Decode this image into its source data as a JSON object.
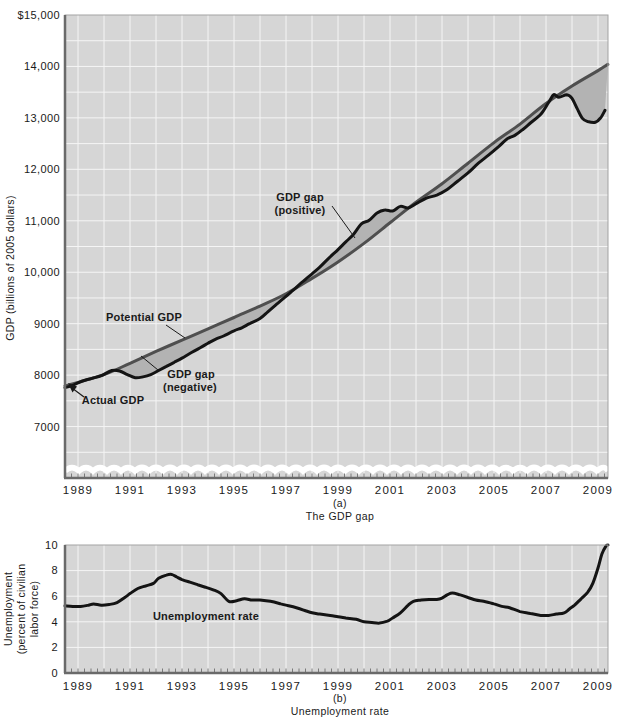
{
  "colors": {
    "page_bg": "#ffffff",
    "plot_bg": "#d6d6d6",
    "grid": "#f5f5f5",
    "actual_line": "#141414",
    "potential_line": "#4f4f4f",
    "unemployment_line": "#141414",
    "gap_fill": "#b3b3b3",
    "frame": "#a3a3a3",
    "axis_dark": "#6a6a6a",
    "tick_mark": "#7a7a7a",
    "text": "#1a1a1a"
  },
  "panel_a": {
    "axis_title": "GDP (billions of 2005 dollars)",
    "y_ticks": [
      "$15,000",
      "14,000",
      "13,000",
      "12,000",
      "11,000",
      "10,000",
      "9000",
      "8000",
      "7000"
    ],
    "x_ticks": [
      "1989",
      "1991",
      "1993",
      "1995",
      "1997",
      "1999",
      "2001",
      "2003",
      "2005",
      "2007",
      "2009"
    ],
    "annotations": {
      "gap_positive_line1": "GDP gap",
      "gap_positive_line2": "(positive)",
      "potential": "Potential GDP",
      "gap_negative_line1": "GDP gap",
      "gap_negative_line2": "(negative)",
      "actual": "Actual GDP"
    },
    "caption_letter": "(a)",
    "caption_title": "The GDP gap"
  },
  "panel_b": {
    "axis_title_line1": "Unemployment",
    "axis_title_line2": "(percent of civilian",
    "axis_title_line3": "labor force)",
    "y_ticks": [
      "10",
      "8",
      "6",
      "4",
      "2",
      "0"
    ],
    "x_ticks": [
      "1989",
      "1991",
      "1993",
      "1995",
      "1997",
      "1999",
      "2001",
      "2003",
      "2005",
      "2007",
      "2009"
    ],
    "annotation": "Unemployment rate",
    "caption_letter": "(b)",
    "caption_title": "Unemployment rate"
  },
  "chart_data": [
    {
      "type": "line",
      "panel": "(a)",
      "title": "The GDP gap",
      "ylabel": "GDP (billions of 2005 dollars)",
      "xlim": [
        1988.5,
        2009.385
      ],
      "ylim": [
        6000,
        15000
      ],
      "axis_break_at_bottom": true,
      "grid": "fine white grid, yearly vertical lines, horizontal lines every 500",
      "x_tick_values": [
        1989,
        1991,
        1993,
        1995,
        1997,
        1999,
        2001,
        2003,
        2005,
        2007,
        2009
      ],
      "y_tick_values": [
        15000,
        14000,
        13000,
        12000,
        11000,
        10000,
        9000,
        8000,
        7000
      ],
      "gap_fill_color": "#b3b3b3",
      "series": [
        {
          "name": "Actual GDP",
          "color": "#141414",
          "points": [
            [
              1988.5,
              7755
            ],
            [
              1988.8,
              7800
            ],
            [
              1989.0,
              7850
            ],
            [
              1989.3,
              7905
            ],
            [
              1989.6,
              7945
            ],
            [
              1989.9,
              7990
            ],
            [
              1990.3,
              8090
            ],
            [
              1990.6,
              8080
            ],
            [
              1990.9,
              8010
            ],
            [
              1991.2,
              7950
            ],
            [
              1991.5,
              7965
            ],
            [
              1991.8,
              8010
            ],
            [
              1992.1,
              8090
            ],
            [
              1992.4,
              8170
            ],
            [
              1992.7,
              8250
            ],
            [
              1993.0,
              8330
            ],
            [
              1993.3,
              8420
            ],
            [
              1993.7,
              8530
            ],
            [
              1994.0,
              8620
            ],
            [
              1994.3,
              8700
            ],
            [
              1994.6,
              8760
            ],
            [
              1995.0,
              8860
            ],
            [
              1995.3,
              8920
            ],
            [
              1995.6,
              9000
            ],
            [
              1996.0,
              9100
            ],
            [
              1996.3,
              9230
            ],
            [
              1996.6,
              9360
            ],
            [
              1997.0,
              9530
            ],
            [
              1997.3,
              9660
            ],
            [
              1997.6,
              9800
            ],
            [
              1998.0,
              9970
            ],
            [
              1998.3,
              10100
            ],
            [
              1998.6,
              10250
            ],
            [
              1999.0,
              10440
            ],
            [
              1999.3,
              10590
            ],
            [
              1999.6,
              10740
            ],
            [
              1999.9,
              10940
            ],
            [
              2000.2,
              11010
            ],
            [
              2000.5,
              11150
            ],
            [
              2000.8,
              11210
            ],
            [
              2001.1,
              11190
            ],
            [
              2001.4,
              11280
            ],
            [
              2001.7,
              11250
            ],
            [
              2002.0,
              11330
            ],
            [
              2002.4,
              11440
            ],
            [
              2002.8,
              11500
            ],
            [
              2003.2,
              11610
            ],
            [
              2003.6,
              11770
            ],
            [
              2004.0,
              11930
            ],
            [
              2004.4,
              12120
            ],
            [
              2004.8,
              12280
            ],
            [
              2005.2,
              12450
            ],
            [
              2005.5,
              12590
            ],
            [
              2005.8,
              12660
            ],
            [
              2006.1,
              12770
            ],
            [
              2006.4,
              12900
            ],
            [
              2006.8,
              13070
            ],
            [
              2007.1,
              13300
            ],
            [
              2007.3,
              13450
            ],
            [
              2007.5,
              13400
            ],
            [
              2007.8,
              13450
            ],
            [
              2008.0,
              13380
            ],
            [
              2008.2,
              13180
            ],
            [
              2008.4,
              12990
            ],
            [
              2008.6,
              12930
            ],
            [
              2008.9,
              12915
            ],
            [
              2009.1,
              13000
            ],
            [
              2009.27,
              13150
            ]
          ]
        },
        {
          "name": "Potential GDP",
          "color": "#4f4f4f",
          "points": [
            [
              1988.5,
              7790
            ],
            [
              1990,
              8010
            ],
            [
              1991,
              8230
            ],
            [
              1992,
              8460
            ],
            [
              1993,
              8680
            ],
            [
              1994,
              8900
            ],
            [
              1995,
              9120
            ],
            [
              1996,
              9340
            ],
            [
              1997,
              9580
            ],
            [
              1998,
              9880
            ],
            [
              1999,
              10200
            ],
            [
              2000,
              10560
            ],
            [
              2001,
              10960
            ],
            [
              2002,
              11360
            ],
            [
              2003,
              11720
            ],
            [
              2004,
              12120
            ],
            [
              2005,
              12520
            ],
            [
              2006,
              12880
            ],
            [
              2007,
              13280
            ],
            [
              2008,
              13620
            ],
            [
              2009,
              13920
            ],
            [
              2009.38,
              14040
            ]
          ]
        }
      ]
    },
    {
      "type": "line",
      "panel": "(b)",
      "title": "Unemployment rate",
      "ylabel": "Unemployment (percent of civilian labor force)",
      "xlim": [
        1988.5,
        2009.385
      ],
      "ylim": [
        0,
        10
      ],
      "x_tick_values": [
        1989,
        1991,
        1993,
        1995,
        1997,
        1999,
        2001,
        2003,
        2005,
        2007,
        2009
      ],
      "y_tick_values": [
        0,
        2,
        4,
        6,
        8,
        10
      ],
      "series": [
        {
          "name": "Unemployment rate",
          "color": "#141414",
          "points": [
            [
              1988.5,
              5.25
            ],
            [
              1988.8,
              5.2
            ],
            [
              1989.1,
              5.2
            ],
            [
              1989.4,
              5.3
            ],
            [
              1989.6,
              5.4
            ],
            [
              1989.9,
              5.3
            ],
            [
              1990.2,
              5.35
            ],
            [
              1990.5,
              5.5
            ],
            [
              1990.8,
              5.9
            ],
            [
              1991.0,
              6.2
            ],
            [
              1991.3,
              6.6
            ],
            [
              1991.6,
              6.8
            ],
            [
              1991.9,
              7.0
            ],
            [
              1992.1,
              7.4
            ],
            [
              1992.4,
              7.65
            ],
            [
              1992.6,
              7.7
            ],
            [
              1992.8,
              7.5
            ],
            [
              1993.0,
              7.3
            ],
            [
              1993.3,
              7.1
            ],
            [
              1993.6,
              6.9
            ],
            [
              1993.9,
              6.7
            ],
            [
              1994.2,
              6.5
            ],
            [
              1994.5,
              6.2
            ],
            [
              1994.8,
              5.6
            ],
            [
              1995.1,
              5.65
            ],
            [
              1995.4,
              5.8
            ],
            [
              1995.7,
              5.7
            ],
            [
              1996.0,
              5.7
            ],
            [
              1996.4,
              5.6
            ],
            [
              1996.8,
              5.4
            ],
            [
              1997.1,
              5.25
            ],
            [
              1997.4,
              5.1
            ],
            [
              1997.7,
              4.9
            ],
            [
              1998.0,
              4.7
            ],
            [
              1998.3,
              4.6
            ],
            [
              1998.7,
              4.5
            ],
            [
              1999.0,
              4.4
            ],
            [
              1999.3,
              4.3
            ],
            [
              1999.7,
              4.2
            ],
            [
              2000.0,
              4.0
            ],
            [
              2000.3,
              3.95
            ],
            [
              2000.6,
              3.9
            ],
            [
              2000.9,
              4.05
            ],
            [
              2001.1,
              4.3
            ],
            [
              2001.4,
              4.7
            ],
            [
              2001.7,
              5.3
            ],
            [
              2001.9,
              5.6
            ],
            [
              2002.2,
              5.7
            ],
            [
              2002.5,
              5.75
            ],
            [
              2002.8,
              5.75
            ],
            [
              2003.0,
              5.85
            ],
            [
              2003.2,
              6.1
            ],
            [
              2003.4,
              6.25
            ],
            [
              2003.7,
              6.1
            ],
            [
              2004.0,
              5.9
            ],
            [
              2004.3,
              5.7
            ],
            [
              2004.6,
              5.6
            ],
            [
              2005.0,
              5.4
            ],
            [
              2005.3,
              5.2
            ],
            [
              2005.6,
              5.1
            ],
            [
              2006.0,
              4.8
            ],
            [
              2006.4,
              4.65
            ],
            [
              2006.8,
              4.5
            ],
            [
              2007.1,
              4.5
            ],
            [
              2007.4,
              4.6
            ],
            [
              2007.7,
              4.7
            ],
            [
              2007.9,
              5.0
            ],
            [
              2008.1,
              5.3
            ],
            [
              2008.35,
              5.8
            ],
            [
              2008.6,
              6.3
            ],
            [
              2008.8,
              7.0
            ],
            [
              2009.0,
              8.2
            ],
            [
              2009.15,
              9.3
            ],
            [
              2009.3,
              9.9
            ],
            [
              2009.38,
              10.0
            ]
          ]
        }
      ]
    }
  ]
}
